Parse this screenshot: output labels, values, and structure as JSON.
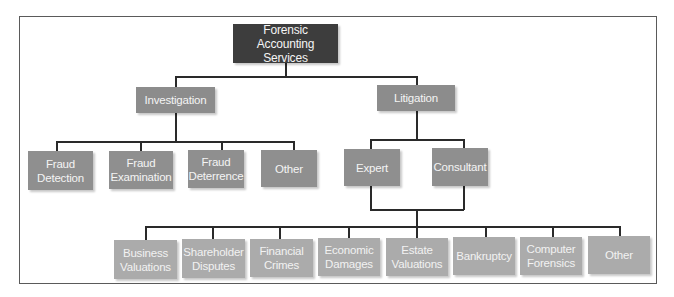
{
  "diagram": {
    "type": "org-chart",
    "root": {
      "label": "Forensic Accounting Services",
      "line1": "Forensic Accounting",
      "line2": "Services"
    },
    "level1": [
      {
        "id": "investigation",
        "label": "Investigation"
      },
      {
        "id": "litigation",
        "label": "Litigation"
      }
    ],
    "investigation_children": [
      {
        "line1": "Fraud",
        "line2": "Detection",
        "label": "Fraud Detection"
      },
      {
        "line1": "Fraud",
        "line2": "Examination",
        "label": "Fraud Examination"
      },
      {
        "line1": "Fraud",
        "line2": "Deterrence",
        "label": "Fraud Deterrence"
      },
      {
        "line1": "Other",
        "line2": "",
        "label": "Other"
      }
    ],
    "litigation_children": [
      {
        "label": "Expert"
      },
      {
        "label": "Consultant"
      }
    ],
    "litigation_services": [
      {
        "line1": "Business",
        "line2": "Valuations",
        "label": "Business Valuations"
      },
      {
        "line1": "Shareholder",
        "line2": "Disputes",
        "label": "Shareholder Disputes"
      },
      {
        "line1": "Financial",
        "line2": "Crimes",
        "label": "Financial Crimes"
      },
      {
        "line1": "Economic",
        "line2": "Damages",
        "label": "Economic Damages"
      },
      {
        "line1": "Estate",
        "line2": "Valuations",
        "label": "Estate Valuations"
      },
      {
        "line1": "Bankruptcy",
        "line2": "",
        "label": "Bankruptcy"
      },
      {
        "line1": "Computer",
        "line2": "Forensics",
        "label": "Computer Forensics"
      },
      {
        "line1": "Other",
        "line2": "",
        "label": "Other"
      }
    ],
    "colors": {
      "root": "#3d3d3d",
      "mid": "#8c8c8c",
      "leaf": "#ababab",
      "connector": "#2a2a2a",
      "text": "#f4f4f4"
    }
  }
}
